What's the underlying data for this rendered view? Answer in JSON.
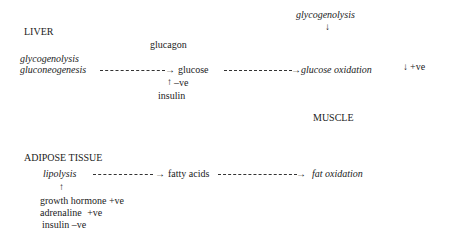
{
  "diagram": {
    "liver": {
      "heading": "LIVER",
      "process_1": "glycogenolysis",
      "process_2": "gluconeogenesis",
      "regulator_top": "glucagon",
      "product": "glucose",
      "inhibit_arrow": "↑",
      "inhibit_label": "–ve",
      "regulator_bottom": "insulin"
    },
    "muscle": {
      "heading": "MUSCLE",
      "process_top": "glycogenolysis",
      "process_top_arrow": "↓",
      "glucose_target": "glucose oxidation",
      "right_arrow": "↓",
      "right_effect": "+ve",
      "fat_target": "fat oxidation"
    },
    "adipose": {
      "heading": "ADIPOSE TISSUE",
      "process": "lipolysis",
      "up_arrow": "↑",
      "product": "fatty acids",
      "regulators": [
        {
          "name": "growth hormone",
          "effect": "+ve"
        },
        {
          "name": "adrenaline",
          "effect": "+ve"
        },
        {
          "name": "insulin",
          "effect": "–ve"
        }
      ]
    },
    "arrowhead": "→"
  }
}
